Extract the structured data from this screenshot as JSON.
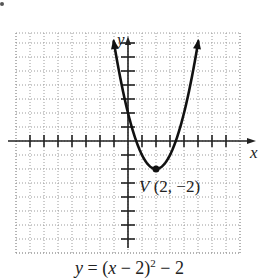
{
  "chart_data": {
    "type": "line",
    "title": "",
    "function": "y = (x - 2)^2 - 2",
    "xlabel": "x",
    "ylabel": "y",
    "xlim": [
      -8,
      8
    ],
    "ylim": [
      -8,
      8
    ],
    "grid": true,
    "grid_style": "dotted",
    "tick_spacing": 1,
    "tick_labels": false,
    "series": [
      {
        "name": "parabola",
        "x": [
          -1,
          0,
          1,
          2,
          3,
          4,
          5
        ],
        "values": [
          7,
          2,
          -1,
          -2,
          -1,
          2,
          7
        ],
        "arrows_at_ends": true
      }
    ],
    "annotations": [
      {
        "label": "V (2, −2)",
        "x": 2,
        "y": -2,
        "marker": "dot"
      }
    ]
  },
  "labels": {
    "y_axis": "y",
    "x_axis": "x",
    "vertex_v": "V",
    "vertex_coords": " (2, −2)",
    "equation_lhs": "y",
    "equation_mid": " = (",
    "equation_x": "x",
    "equation_inner": " − 2)",
    "equation_exp": "2",
    "equation_tail": " − 2"
  },
  "colors": {
    "curve": "#111111",
    "axis": "#222222",
    "grid": "#9a9a9a"
  }
}
